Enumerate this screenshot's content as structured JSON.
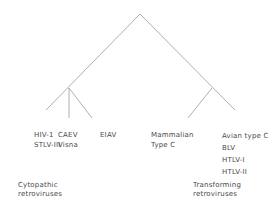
{
  "diagram": {
    "type": "tree",
    "line_color": "#9a9a9a",
    "root": {
      "children": [
        {
          "group": "cytopathic",
          "leaves": [
            {
              "lines": [
                "HIV-1",
                "STLV-III"
              ]
            },
            {
              "lines": [
                "CAEV",
                "Visna"
              ]
            },
            {
              "lines": [
                "EIAV"
              ]
            }
          ]
        },
        {
          "group": "transforming",
          "leaves": [
            {
              "lines": [
                "Mammalian",
                "Type C"
              ]
            },
            {
              "lines": [
                "Avian type C",
                "BLV",
                "HTLV-I",
                "HTLV-II"
              ]
            }
          ]
        }
      ]
    },
    "groups": {
      "cytopathic": {
        "line1": "Cytopathic",
        "line2": "retroviruses"
      },
      "transforming": {
        "line1": "Transforming",
        "line2": "retroviruses"
      }
    }
  }
}
